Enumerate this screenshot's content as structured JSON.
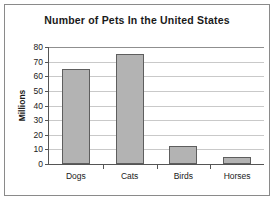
{
  "chart_data": {
    "type": "bar",
    "title": "Number of Pets In the United States",
    "categories": [
      "Dogs",
      "Cats",
      "Birds",
      "Horses"
    ],
    "values": [
      65,
      75,
      12,
      5
    ],
    "xlabel": "",
    "ylabel": "Millions",
    "ylim": [
      0,
      80
    ],
    "ytick_labels": [
      "80",
      "70",
      "60",
      "50",
      "40",
      "30",
      "20",
      "10",
      "0"
    ],
    "ytick_values": [
      80,
      70,
      60,
      50,
      40,
      30,
      20,
      10,
      0
    ],
    "grid": true,
    "legend": false,
    "bar_color": "#b3b3b3",
    "bar_border_color": "#5e5e5e",
    "axis_color": "#555555",
    "grid_color": "#c9c9c9",
    "frame_color": "#8a8a8a",
    "background": "#ffffff"
  }
}
